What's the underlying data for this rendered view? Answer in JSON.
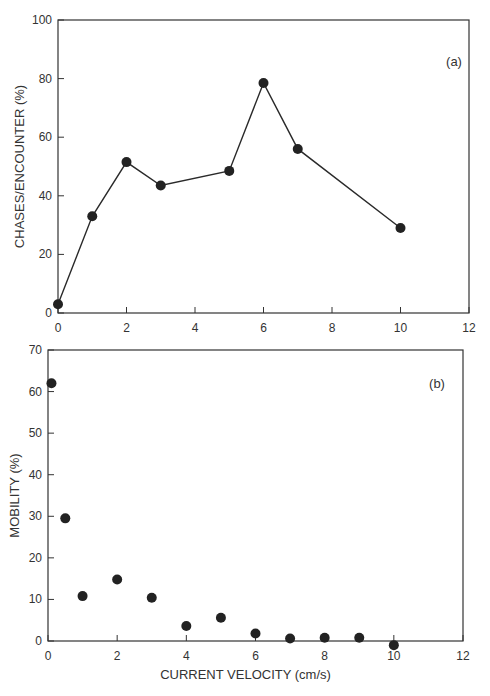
{
  "chart_data": [
    {
      "id": "a",
      "type": "line",
      "panel_label": "(a)",
      "title": "",
      "xlabel": "",
      "ylabel": "CHASES/ENCOUNTER (%)",
      "xlim": [
        0,
        12
      ],
      "ylim": [
        0,
        100
      ],
      "x_ticks": [
        0,
        2,
        4,
        6,
        8,
        10,
        12
      ],
      "y_ticks": [
        0,
        20,
        40,
        60,
        80,
        100
      ],
      "grid": false,
      "markers": true,
      "series": [
        {
          "name": "Chases per encounter",
          "x": [
            0,
            1,
            2,
            3,
            5,
            6,
            7,
            10
          ],
          "y": [
            3,
            33,
            51.5,
            43.5,
            48.5,
            78.5,
            56,
            29
          ]
        }
      ]
    },
    {
      "id": "b",
      "type": "scatter",
      "panel_label": "(b)",
      "title": "",
      "xlabel": "CURRENT VELOCITY (cm/s)",
      "ylabel": "MOBILITY (%)",
      "xlim": [
        0,
        12
      ],
      "ylim": [
        0,
        70
      ],
      "x_ticks": [
        0,
        2,
        4,
        6,
        8,
        10,
        12
      ],
      "y_ticks": [
        0,
        10,
        20,
        30,
        40,
        50,
        60,
        70
      ],
      "grid": false,
      "series": [
        {
          "name": "Mobility",
          "x": [
            0.1,
            0.5,
            1,
            2,
            3,
            4,
            5,
            6,
            7,
            8,
            9,
            10
          ],
          "y": [
            62,
            29.5,
            10.8,
            14.8,
            10.4,
            3.6,
            5.6,
            1.8,
            0.6,
            0.8,
            0.8,
            -1
          ]
        }
      ]
    }
  ]
}
